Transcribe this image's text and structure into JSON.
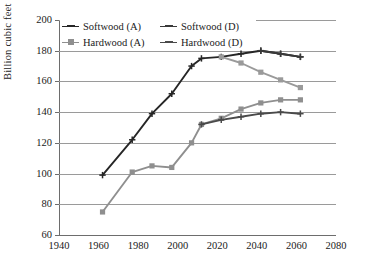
{
  "chart_data": {
    "type": "line",
    "title": "",
    "xlabel": "",
    "ylabel": "Billion cubic feet",
    "xlim": [
      1940,
      2080
    ],
    "ylim": [
      60,
      200
    ],
    "xticks": [
      1940,
      1960,
      1980,
      2000,
      2020,
      2040,
      2060,
      2080
    ],
    "yticks": [
      60,
      80,
      100,
      120,
      140,
      160,
      180,
      200
    ],
    "grid": "horizontal",
    "legend_position": "top-left-inside",
    "series": [
      {
        "name": "Softwood (A)",
        "color": "#262626",
        "marker": "plus",
        "x": [
          1962,
          1977,
          1987,
          1997,
          2007,
          2012,
          2022,
          2032,
          2042,
          2052,
          2062
        ],
        "y": [
          99,
          122,
          139,
          152,
          170,
          175,
          176,
          178,
          180,
          178,
          176
        ]
      },
      {
        "name": "Softwood (D)",
        "color": "#3a3a3a",
        "marker": "plus",
        "x": [
          2042,
          2052,
          2062
        ],
        "y": [
          180,
          178,
          176
        ]
      },
      {
        "name": "Hardwood (A)",
        "color": "#8f8f8f",
        "marker": "square",
        "x": [
          1962,
          1977,
          1987,
          1997,
          2007,
          2012,
          2022,
          2032,
          2042,
          2052,
          2062
        ],
        "y": [
          75,
          101,
          105,
          104,
          120,
          132,
          136,
          142,
          146,
          148,
          148
        ]
      },
      {
        "name": "Hardwood (D)",
        "color": "#4a4a4a",
        "marker": "plus",
        "x": [
          2012,
          2022,
          2032,
          2042,
          2052,
          2062
        ],
        "y": [
          132,
          135,
          137,
          139,
          140,
          139
        ]
      },
      {
        "name": "Softwood (A) upper-declining",
        "color": "#9a9a9a",
        "marker": "square",
        "x": [
          2022,
          2032,
          2042,
          2052,
          2062
        ],
        "y": [
          176,
          172,
          166,
          161,
          156
        ]
      }
    ],
    "annotations": []
  },
  "legend": {
    "entries": [
      {
        "label": "Softwood (A)",
        "color": "#262626",
        "marker": "plus"
      },
      {
        "label": "Softwood (D)",
        "color": "#3a3a3a",
        "marker": "plus"
      },
      {
        "label": "Hardwood (A)",
        "color": "#8f8f8f",
        "marker": "square"
      },
      {
        "label": "Hardwood (D)",
        "color": "#4a4a4a",
        "marker": "plus"
      }
    ]
  },
  "axes": {
    "ylabel": "Billion cubic feet",
    "ytick_labels": [
      "200",
      "180",
      "160",
      "140",
      "120",
      "100",
      "80",
      "60"
    ],
    "xtick_labels": [
      "1940",
      "1960",
      "1980",
      "2000",
      "2020",
      "2040",
      "2060",
      "2080"
    ]
  },
  "colors": {
    "grid": "#9a9a9a",
    "axis": "#6d6d6d",
    "background": "#ffffff",
    "text": "#1a1a1a",
    "softwood_dark": "#262626",
    "hardwood_gray": "#8f8f8f"
  }
}
